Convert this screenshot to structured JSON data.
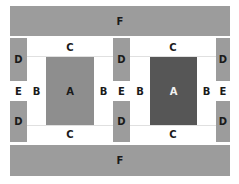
{
  "colors": {
    "gray": "#9c9c9c",
    "a_light": "#8e8e8e",
    "a_dark": "#565656",
    "white": "#ffffff"
  },
  "labels": {
    "F_top": "F",
    "F_bottom": "F",
    "left": {
      "C_top": "C",
      "C_bottom": "C",
      "A": "A",
      "B_left": "B",
      "B_right": "B"
    },
    "right": {
      "C_top": "C",
      "C_bottom": "C",
      "A": "A",
      "B_left": "B",
      "B_right": "B"
    },
    "D": [
      "D",
      "D",
      "D",
      "D",
      "D",
      "D"
    ],
    "E": [
      "E",
      "E",
      "E"
    ]
  }
}
